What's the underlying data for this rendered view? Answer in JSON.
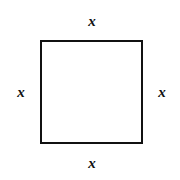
{
  "figure": {
    "type": "square-with-side-labels",
    "background_color": "#ffffff",
    "stroke_color": "#111111",
    "label_color": "#111111",
    "fill": "none",
    "shape_name": "square",
    "labels": {
      "top": "x",
      "right": "x",
      "bottom": "x",
      "left": "x"
    }
  }
}
